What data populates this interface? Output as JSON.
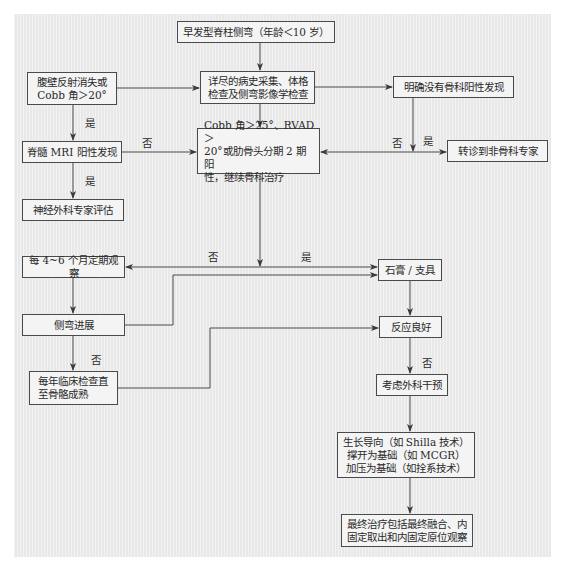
{
  "diagram": {
    "type": "flowchart",
    "colors": {
      "panel_bg": "#ececec",
      "box_bg": "#f4f4f4",
      "border": "#4a4a4a",
      "text": "#2a2a2a"
    },
    "nodes": {
      "start": "早发型脊柱侧弯（年龄＜10 岁）",
      "history_exam": "详尽的病史采集、体格\n检查及侧弯影像学检查",
      "reflex_cobb": "腹壁反射消失或\nCobb 角＞20°",
      "no_ortho_finding": "明确没有骨科阳性发现",
      "mri_positive": "脊髓 MRI 阳性发现",
      "cobb_criteria": "Cobb 角＞25°、RVAD＞\n20°或肋骨头分期 2 期阳\n性，继续骨科治疗",
      "refer_non_ortho": "转诊到非骨科专家",
      "neurosurgery_eval": "神经外科专家评估",
      "observe_4_6_months": "每 4~6 个月定期观察",
      "cast_brace": "石膏 / 支具",
      "curve_progression": "侧弯进展",
      "good_response": "反应良好",
      "annual_exam": "每年临床检查直\n至骨骼成熟",
      "consider_surgery": "考虑外科干预",
      "surgical_options": "生长导向（如 Shilla 技术）\n撑开为基础（如 MCGR）\n加压为基础（如拴系技术）",
      "final_treatment": "最终治疗包括最终融合、内\n固定取出和内固定原位观察"
    },
    "edge_labels": {
      "reflex_to_mri_yes": "是",
      "mri_to_neuro_yes": "是",
      "mri_to_cobb_no": "否",
      "cobb_refer_no": "否",
      "cobb_refer_yes": "是",
      "cobb_to_observe_no": "否",
      "cobb_to_cast_yes": "是",
      "progression_no": "否",
      "response_no": "否"
    }
  }
}
